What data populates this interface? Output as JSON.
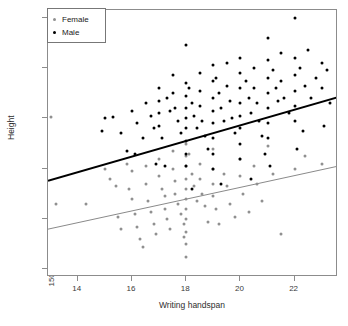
{
  "chart_data": {
    "type": "scatter",
    "title": "",
    "xlabel": "Writing handspan",
    "ylabel": "Height",
    "xlim": [
      12.9,
      23.6
    ],
    "ylim": [
      148.5,
      201.5
    ],
    "xticks": [
      14,
      16,
      18,
      20,
      22
    ],
    "yticks": [
      150,
      160,
      170,
      180,
      190,
      200
    ],
    "grid": false,
    "legend_position": "top-left",
    "legend": [
      {
        "label": "Female",
        "color": "#909090"
      },
      {
        "label": "Male",
        "color": "#000000"
      }
    ],
    "series": [
      {
        "name": "Female",
        "color": "#909090",
        "points": [
          [
            13.0,
            180.2
          ],
          [
            13.2,
            163.0
          ],
          [
            14.3,
            163.0
          ],
          [
            15.0,
            170.0
          ],
          [
            15.2,
            168.0
          ],
          [
            15.4,
            166.5
          ],
          [
            15.5,
            160.5
          ],
          [
            15.6,
            158.0
          ],
          [
            15.8,
            171.0
          ],
          [
            15.9,
            166.0
          ],
          [
            16.0,
            169.5
          ],
          [
            16.0,
            164.0
          ],
          [
            16.1,
            161.0
          ],
          [
            16.2,
            158.5
          ],
          [
            16.3,
            156.0
          ],
          [
            16.4,
            154.5
          ],
          [
            16.5,
            170.5
          ],
          [
            16.5,
            167.0
          ],
          [
            16.6,
            163.5
          ],
          [
            16.7,
            161.5
          ],
          [
            16.8,
            159.0
          ],
          [
            16.9,
            157.0
          ],
          [
            17.0,
            172.0
          ],
          [
            17.0,
            168.5
          ],
          [
            17.1,
            166.0
          ],
          [
            17.2,
            164.5
          ],
          [
            17.2,
            162.0
          ],
          [
            17.3,
            160.0
          ],
          [
            17.4,
            158.0
          ],
          [
            17.5,
            173.5
          ],
          [
            17.5,
            170.0
          ],
          [
            17.6,
            167.5
          ],
          [
            17.6,
            165.0
          ],
          [
            17.7,
            163.0
          ],
          [
            17.8,
            161.0
          ],
          [
            17.9,
            159.0
          ],
          [
            17.9,
            156.5
          ],
          [
            18.0,
            175.0
          ],
          [
            18.0,
            172.5
          ],
          [
            18.0,
            170.5
          ],
          [
            18.0,
            168.0
          ],
          [
            18.0,
            166.0
          ],
          [
            18.0,
            164.0
          ],
          [
            18.0,
            162.0
          ],
          [
            18.0,
            160.0
          ],
          [
            18.0,
            157.5
          ],
          [
            18.0,
            155.0
          ],
          [
            18.0,
            152.5
          ],
          [
            18.1,
            173.0
          ],
          [
            18.2,
            169.0
          ],
          [
            18.3,
            166.5
          ],
          [
            18.4,
            163.5
          ],
          [
            18.5,
            171.0
          ],
          [
            18.5,
            168.0
          ],
          [
            18.6,
            165.0
          ],
          [
            18.7,
            162.5
          ],
          [
            18.8,
            159.5
          ],
          [
            19.0,
            174.0
          ],
          [
            19.0,
            170.0
          ],
          [
            19.0,
            167.0
          ],
          [
            19.0,
            164.5
          ],
          [
            19.1,
            162.0
          ],
          [
            19.2,
            159.0
          ],
          [
            19.4,
            169.0
          ],
          [
            19.5,
            166.5
          ],
          [
            19.6,
            163.0
          ],
          [
            19.8,
            160.5
          ],
          [
            20.0,
            172.0
          ],
          [
            20.0,
            168.5
          ],
          [
            20.1,
            165.0
          ],
          [
            20.3,
            161.5
          ],
          [
            20.5,
            170.5
          ],
          [
            20.6,
            167.0
          ],
          [
            20.8,
            163.5
          ],
          [
            21.0,
            174.5
          ],
          [
            21.2,
            169.0
          ],
          [
            21.5,
            157.0
          ],
          [
            22.0,
            170.0
          ],
          [
            22.4,
            172.5
          ],
          [
            23.0,
            171.0
          ]
        ]
      },
      {
        "name": "Male",
        "color": "#000000",
        "points": [
          [
            15.0,
            180.0
          ],
          [
            15.3,
            180.2
          ],
          [
            15.6,
            177.0
          ],
          [
            16.0,
            181.5
          ],
          [
            16.2,
            179.0
          ],
          [
            16.4,
            176.0
          ],
          [
            16.5,
            183.0
          ],
          [
            16.7,
            180.5
          ],
          [
            16.8,
            178.0
          ],
          [
            17.0,
            186.0
          ],
          [
            17.0,
            183.5
          ],
          [
            17.0,
            181.0
          ],
          [
            17.0,
            178.5
          ],
          [
            17.1,
            176.0
          ],
          [
            17.3,
            184.0
          ],
          [
            17.4,
            181.5
          ],
          [
            17.5,
            188.5
          ],
          [
            17.5,
            185.0
          ],
          [
            17.6,
            182.0
          ],
          [
            17.7,
            179.5
          ],
          [
            17.8,
            177.0
          ],
          [
            18.0,
            194.5
          ],
          [
            18.0,
            187.0
          ],
          [
            18.0,
            184.5
          ],
          [
            18.0,
            182.0
          ],
          [
            18.0,
            180.0
          ],
          [
            18.0,
            178.0
          ],
          [
            18.0,
            175.5
          ],
          [
            18.0,
            173.0
          ],
          [
            18.0,
            170.5
          ],
          [
            18.1,
            186.0
          ],
          [
            18.2,
            183.0
          ],
          [
            18.3,
            180.5
          ],
          [
            18.4,
            178.0
          ],
          [
            18.5,
            189.0
          ],
          [
            18.5,
            185.5
          ],
          [
            18.5,
            182.5
          ],
          [
            18.6,
            179.5
          ],
          [
            18.7,
            176.5
          ],
          [
            18.8,
            174.0
          ],
          [
            19.0,
            190.5
          ],
          [
            19.0,
            187.5
          ],
          [
            19.0,
            184.0
          ],
          [
            19.0,
            181.5
          ],
          [
            19.0,
            179.0
          ],
          [
            19.0,
            176.0
          ],
          [
            19.0,
            173.0
          ],
          [
            19.0,
            170.0
          ],
          [
            19.1,
            188.0
          ],
          [
            19.2,
            185.0
          ],
          [
            19.3,
            182.0
          ],
          [
            19.4,
            179.5
          ],
          [
            19.5,
            191.0
          ],
          [
            19.5,
            186.5
          ],
          [
            19.6,
            183.5
          ],
          [
            19.7,
            180.0
          ],
          [
            19.8,
            177.0
          ],
          [
            20.0,
            192.0
          ],
          [
            20.0,
            189.0
          ],
          [
            20.0,
            186.0
          ],
          [
            20.0,
            183.0
          ],
          [
            20.0,
            180.5
          ],
          [
            20.0,
            178.0
          ],
          [
            20.0,
            175.0
          ],
          [
            20.0,
            172.0
          ],
          [
            20.2,
            187.5
          ],
          [
            20.3,
            184.0
          ],
          [
            20.4,
            181.0
          ],
          [
            20.5,
            190.0
          ],
          [
            20.5,
            186.0
          ],
          [
            20.6,
            183.0
          ],
          [
            20.7,
            179.5
          ],
          [
            20.8,
            176.5
          ],
          [
            21.0,
            196.0
          ],
          [
            21.0,
            191.5
          ],
          [
            21.0,
            188.0
          ],
          [
            21.0,
            185.0
          ],
          [
            21.0,
            182.0
          ],
          [
            21.0,
            179.0
          ],
          [
            21.0,
            176.0
          ],
          [
            21.2,
            189.5
          ],
          [
            21.3,
            186.0
          ],
          [
            21.4,
            183.5
          ],
          [
            21.5,
            193.0
          ],
          [
            21.5,
            187.5
          ],
          [
            21.6,
            184.0
          ],
          [
            21.8,
            181.0
          ],
          [
            22.0,
            200.0
          ],
          [
            22.0,
            192.0
          ],
          [
            22.0,
            188.5
          ],
          [
            22.0,
            185.5
          ],
          [
            22.0,
            182.5
          ],
          [
            22.0,
            179.5
          ],
          [
            22.2,
            190.0
          ],
          [
            22.4,
            186.5
          ],
          [
            22.5,
            193.5
          ],
          [
            22.6,
            184.0
          ],
          [
            22.8,
            188.0
          ],
          [
            23.0,
            191.0
          ],
          [
            23.0,
            186.0
          ],
          [
            23.2,
            189.5
          ],
          [
            23.3,
            183.0
          ],
          [
            14.9,
            177.5
          ],
          [
            16.1,
            173.0
          ],
          [
            17.2,
            170.5
          ],
          [
            18.2,
            166.0
          ],
          [
            19.3,
            167.0
          ],
          [
            20.4,
            168.0
          ],
          [
            21.1,
            170.5
          ],
          [
            22.1,
            174.0
          ],
          [
            15.8,
            173.5
          ],
          [
            16.9,
            171.0
          ],
          [
            20.9,
            173.0
          ],
          [
            22.3,
            177.5
          ],
          [
            23.1,
            178.5
          ]
        ]
      }
    ],
    "trendlines": [
      {
        "name": "Male",
        "color": "#000000",
        "width": 2,
        "x0": 12.9,
        "y0": 167.6,
        "x1": 23.6,
        "y1": 184.2
      },
      {
        "name": "Female",
        "color": "#8a8a8a",
        "width": 1,
        "x0": 12.9,
        "y0": 158.0,
        "x1": 23.6,
        "y1": 170.5
      }
    ]
  }
}
